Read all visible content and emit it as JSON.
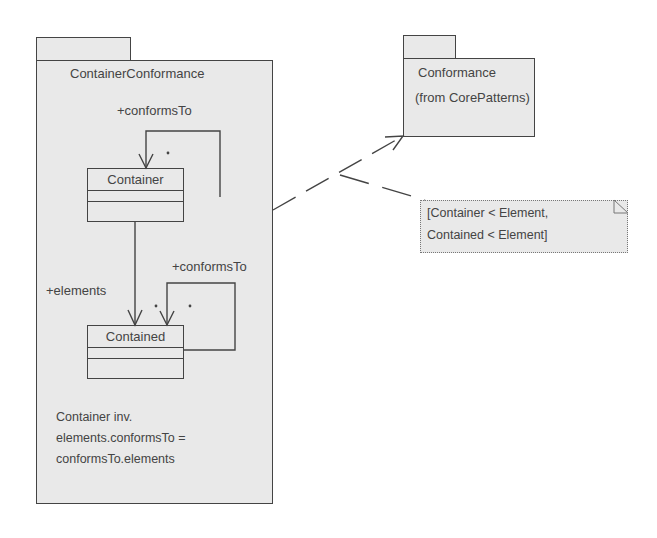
{
  "diagram": {
    "main_package": {
      "name": "ContainerConformance",
      "constraint_lines": [
        "Container inv.",
        "elements.conformsTo =",
        "conformsTo.elements"
      ]
    },
    "classes": [
      {
        "name": "Container"
      },
      {
        "name": "Contained"
      }
    ],
    "associations": {
      "container_self": {
        "role": "+conformsTo",
        "multiplicity": "*"
      },
      "container_to_contained": {
        "role": "+elements",
        "multiplicity": "*"
      },
      "contained_self": {
        "role": "+conformsTo",
        "multiplicity": "*"
      }
    },
    "target_package": {
      "name": "Conformance",
      "origin": "(from CorePatterns)"
    },
    "note": {
      "lines": [
        "[Container < Element,",
        "Contained < Element]"
      ]
    },
    "colors": {
      "fill": "#e9e9e9",
      "stroke": "#444444",
      "background": "#ffffff"
    }
  }
}
